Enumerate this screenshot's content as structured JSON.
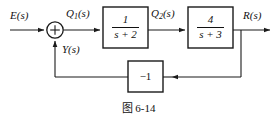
{
  "figure": {
    "caption": "图 6-14",
    "type": "control-system-block-diagram"
  },
  "signals": {
    "input": "E(s)",
    "after_sum": "Q",
    "after_sum_sub": "1",
    "after_sum_tail": "(s)",
    "after_block1": "Q",
    "after_block1_sub": "2",
    "after_block1_tail": "(s)",
    "output": "R(s)",
    "feedback": "Y(s)"
  },
  "summing_junction": {
    "name": "summing-junction",
    "sign": "+"
  },
  "blocks": [
    {
      "id": "block-1",
      "numerator": "1",
      "denominator": "s + 2"
    },
    {
      "id": "block-2",
      "numerator": "4",
      "denominator": "s + 3"
    },
    {
      "id": "feedback-block",
      "gain": "−1"
    }
  ],
  "colors": {
    "line": "#1a1a1a",
    "text": "#111111",
    "background": "#ffffff"
  }
}
